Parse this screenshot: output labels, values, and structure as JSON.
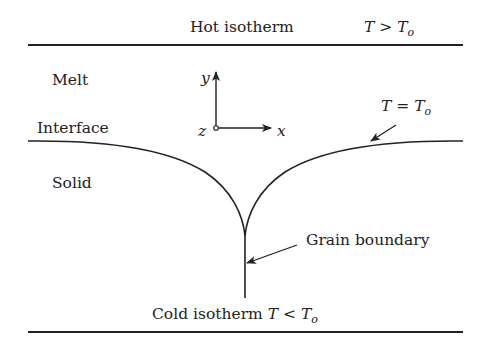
{
  "diagram": {
    "colors": {
      "line": "#222222",
      "background": "#ffffff"
    },
    "top_boundary": {
      "label": "Hot isotherm",
      "condition": {
        "lhs": "T",
        "op": ">",
        "rhs": "T",
        "rhs_sub": "o"
      }
    },
    "bottom_boundary": {
      "label": "Cold isotherm",
      "condition": {
        "lhs": "T",
        "op": "<",
        "rhs": "T",
        "rhs_sub": "o"
      }
    },
    "regions": {
      "melt": "Melt",
      "interface": "Interface",
      "solid": "Solid"
    },
    "interface_condition": {
      "lhs": "T",
      "op": "=",
      "rhs": "T",
      "rhs_sub": "o"
    },
    "grain_boundary_label": "Grain boundary",
    "axes": {
      "x": "x",
      "y": "y",
      "z": "z"
    }
  }
}
